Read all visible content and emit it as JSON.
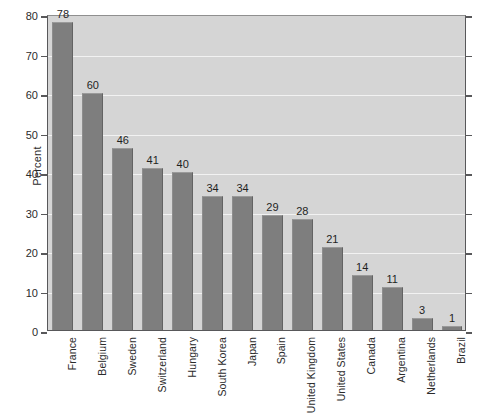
{
  "chart_data": {
    "type": "bar",
    "title": "",
    "subtitle": "",
    "xlabel": "",
    "ylabel": "Percent",
    "ylim": [
      0,
      80
    ],
    "yticks": [
      0,
      10,
      20,
      30,
      40,
      50,
      60,
      70,
      80
    ],
    "ytick_labels": [
      "0",
      "10",
      "20",
      "30",
      "40",
      "50",
      "60",
      "70",
      "80"
    ],
    "grid": "horizontal",
    "legend": "none",
    "bar_value_labels": true,
    "categories": [
      "France",
      "Belgium",
      "Sweden",
      "Switzerland",
      "Hungary",
      "South Korea",
      "Japan",
      "Spain",
      "United Kingdom",
      "United States",
      "Canada",
      "Argentina",
      "Netherlands",
      "Brazil"
    ],
    "values": [
      78,
      60,
      46,
      41,
      40,
      34,
      34,
      29,
      28,
      21,
      14,
      11,
      3,
      1
    ],
    "value_labels": [
      "78",
      "60",
      "46",
      "41",
      "40",
      "34",
      "34",
      "29",
      "28",
      "21",
      "14",
      "11",
      "3",
      "1"
    ],
    "colors": {
      "bar_fill": "#7e7e7e",
      "plot_background": "#d5d5d5",
      "page_background": "#ffffff",
      "gridline": "#f2f2f2",
      "axis": "#58585a",
      "text": "#2b2b2b"
    }
  }
}
